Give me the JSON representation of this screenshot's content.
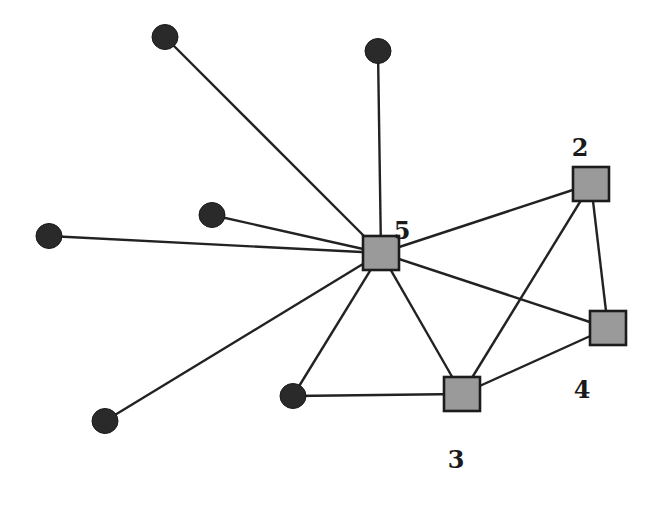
{
  "diagram": {
    "type": "network-graph",
    "colors": {
      "edge": "#222222",
      "circle_fill": "#2a2a2a",
      "square_fill": "#9a9a9a",
      "square_border": "#1c1c1c",
      "label": "#1a1a1a"
    },
    "square_nodes": [
      {
        "id": "5",
        "label": "5",
        "x": 381,
        "y": 253,
        "label_x": 402,
        "label_y": 232
      },
      {
        "id": "2",
        "label": "2",
        "x": 591,
        "y": 184,
        "label_x": 580,
        "label_y": 149
      },
      {
        "id": "4",
        "label": "4",
        "x": 608,
        "y": 328,
        "label_x": 582,
        "label_y": 391
      },
      {
        "id": "3",
        "label": "3",
        "x": 462,
        "y": 394,
        "label_x": 456,
        "label_y": 461
      }
    ],
    "circle_nodes": [
      {
        "id": "c1",
        "x": 165,
        "y": 37
      },
      {
        "id": "c2",
        "x": 378,
        "y": 51
      },
      {
        "id": "c3",
        "x": 212,
        "y": 215
      },
      {
        "id": "c4",
        "x": 49,
        "y": 236
      },
      {
        "id": "c5",
        "x": 105,
        "y": 421
      },
      {
        "id": "c6",
        "x": 293,
        "y": 396
      }
    ],
    "edges": [
      [
        "c1",
        "5"
      ],
      [
        "c2",
        "5"
      ],
      [
        "c3",
        "5"
      ],
      [
        "c4",
        "5"
      ],
      [
        "c5",
        "5"
      ],
      [
        "c6",
        "5"
      ],
      [
        "5",
        "2"
      ],
      [
        "5",
        "4"
      ],
      [
        "5",
        "3"
      ],
      [
        "2",
        "4"
      ],
      [
        "2",
        "3"
      ],
      [
        "3",
        "4"
      ],
      [
        "c6",
        "3"
      ]
    ]
  }
}
